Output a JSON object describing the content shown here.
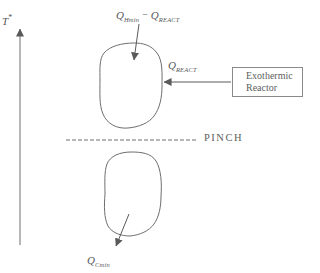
{
  "diagram": {
    "background_color": "#ffffff",
    "line_color": "#6e6e6e",
    "text_color": "#585858",
    "axis": {
      "label": "T",
      "sup": "*"
    },
    "above_pinch_duty": {
      "q1": "Q",
      "q1_sub": "Hmin",
      "op": "−",
      "q2": "Q",
      "q2_sub": "REACT"
    },
    "reactor_duty": {
      "q": "Q",
      "q_sub": "REACT"
    },
    "reactor_box": {
      "line1": "Exothermic",
      "line2": "Reactor"
    },
    "pinch": {
      "label": "PINCH"
    },
    "below_pinch_duty": {
      "q": "Q",
      "q_sub": "Cmin"
    }
  }
}
